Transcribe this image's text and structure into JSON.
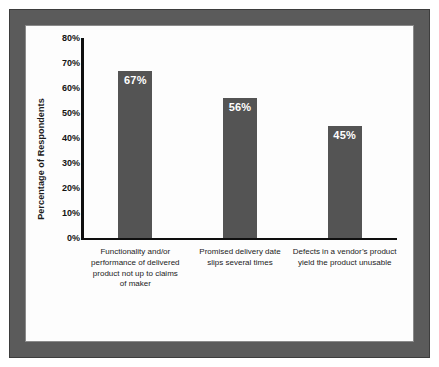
{
  "chart_data": {
    "type": "bar",
    "title": "",
    "subtitle": "",
    "xlabel": "",
    "ylabel": "Percentage of Respondents",
    "ylim": [
      0,
      80
    ],
    "y_ticks": [
      "0%",
      "10%",
      "20%",
      "30%",
      "40%",
      "50%",
      "60%",
      "70%",
      "80%"
    ],
    "y_tick_values": [
      0,
      10,
      20,
      30,
      40,
      50,
      60,
      70,
      80
    ],
    "grid": false,
    "legend": false,
    "legend_position": "none",
    "bar_color": "#545454",
    "value_label_color": "#ffffff",
    "axis_color": "#0f0f0f",
    "categories": [
      "Functionality and/or performance of delivered product not up to claims of maker",
      "Promised delivery date slips several times",
      "Defects in a vendor’s product yield the product unusable"
    ],
    "category_lines": [
      [
        "Functionality and/or",
        "performance of delivered",
        "product not up to claims",
        "of maker"
      ],
      [
        "Promised delivery date",
        "slips several times"
      ],
      [
        "Defects in a vendor’s product",
        "yield the product unusable"
      ]
    ],
    "values": [
      67,
      56,
      45
    ],
    "data_labels": [
      "67%",
      "56%",
      "45%"
    ]
  },
  "figure": {
    "frame_color": "#5b5b5b",
    "plate_color": "#fdfdfd"
  }
}
